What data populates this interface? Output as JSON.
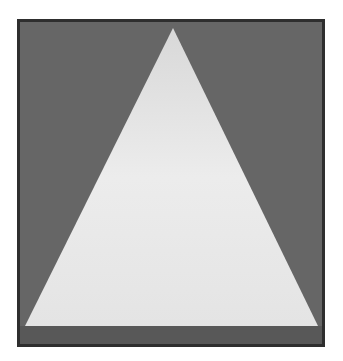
{
  "image": {
    "subject": "white triangle on gray square",
    "colors": {
      "frame_border": "#2e2e2e",
      "background": "#666666",
      "triangle": "#e6e6e6",
      "bottom_band": "#585858"
    },
    "triangle": {
      "apex": [
        173,
        28
      ],
      "base_left": [
        25,
        326
      ],
      "base_right": [
        318,
        326
      ]
    }
  }
}
